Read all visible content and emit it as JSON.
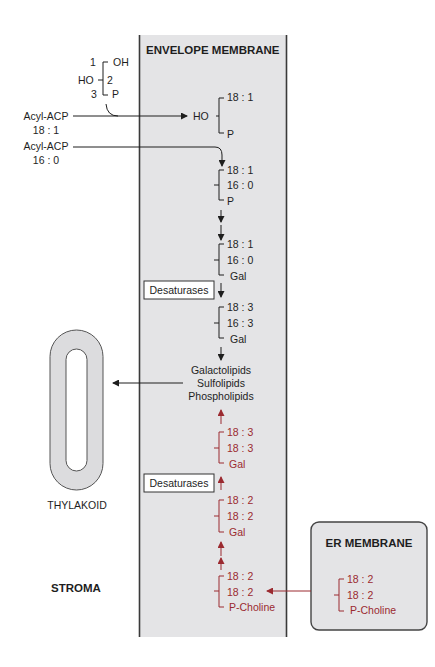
{
  "envelope": {
    "title": "ENVELOPE MEMBRANE",
    "bg": "#e4e4e6",
    "border": "#3a3a3a"
  },
  "glycerol_phosphate": {
    "c1": "1",
    "c1_group": "OH",
    "c2": "2",
    "c2_group": "HO",
    "c3": "3",
    "c3_group": "P"
  },
  "acyl_inputs": [
    {
      "label": "Acyl-ACP",
      "chain": "18 : 1"
    },
    {
      "label": "Acyl-ACP",
      "chain": "16 : 0"
    }
  ],
  "prokaryotic_path": [
    {
      "left": "HO",
      "top": "18 : 1",
      "bottom": "P"
    },
    {
      "top": "18 : 1",
      "mid": "16 : 0",
      "bottom": "P"
    },
    {
      "top": "18 : 1",
      "mid": "16 : 0",
      "bottom": "Gal"
    },
    {
      "top": "18 : 3",
      "mid": "16 : 3",
      "bottom": "Gal"
    }
  ],
  "desaturases_label": "Desaturases",
  "products": [
    "Galactolipids",
    "Sulfolipids",
    "Phospholipids"
  ],
  "eukaryotic_path": [
    {
      "top": "18 : 3",
      "mid": "18 : 3",
      "bottom": "Gal"
    },
    {
      "top": "18 : 2",
      "mid": "18 : 2",
      "bottom": "Gal"
    },
    {
      "top": "18 : 2",
      "mid": "18 : 2",
      "bottom": "P-Choline"
    }
  ],
  "thylakoid": {
    "label": "THYLAKOID"
  },
  "stroma": {
    "label": "STROMA"
  },
  "er": {
    "title": "ER MEMBRANE",
    "lipid": {
      "top": "18 : 2",
      "mid": "18 : 2",
      "bottom": "P-Choline"
    }
  },
  "colors": {
    "red": "#9b2a30",
    "black": "#1e1e1e",
    "gray_fill": "#e4e4e6"
  }
}
